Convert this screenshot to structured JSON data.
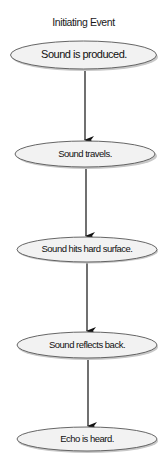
{
  "diagram": {
    "title": "Initiating Event",
    "colors": {
      "node_fill": "#f2f2f2",
      "node_stroke": "#555555",
      "arrow": "#111111",
      "shadow": "#bbbbbb"
    },
    "nodes": [
      {
        "id": "n1",
        "label": "Sound is produced."
      },
      {
        "id": "n2",
        "label": "Sound travels."
      },
      {
        "id": "n3",
        "label": "Sound hits hard surface."
      },
      {
        "id": "n4",
        "label": "Sound reflects back."
      },
      {
        "id": "n5",
        "label": "Echo is heard."
      }
    ],
    "edges": [
      {
        "from": "n1",
        "to": "n2"
      },
      {
        "from": "n2",
        "to": "n3"
      },
      {
        "from": "n3",
        "to": "n4"
      },
      {
        "from": "n4",
        "to": "n5"
      }
    ]
  }
}
